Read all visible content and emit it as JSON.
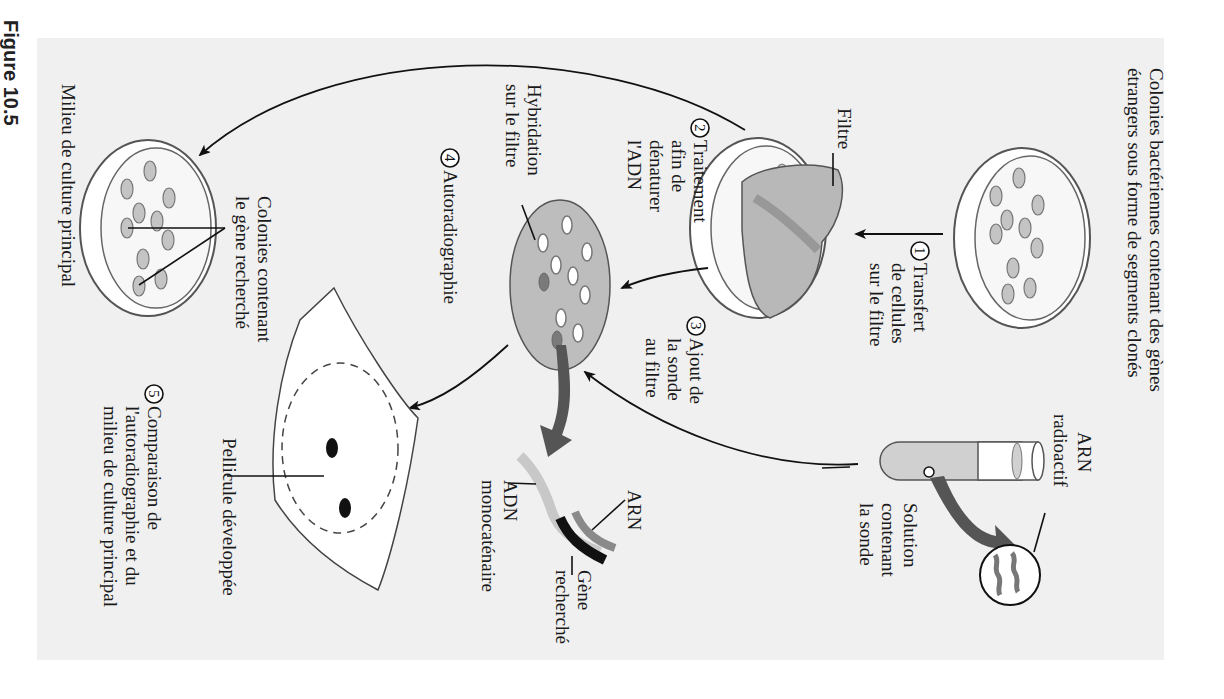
{
  "figure": {
    "label": "Figure 10.5",
    "orientation": "rotated 90° clockwise",
    "colors": {
      "panel_background": "#f0f0f0",
      "colony_fill": "#c4c4c4",
      "filter_fill": "#b8b8b8",
      "rna_strand": "#8a8a8a",
      "dna_strand": "#c8c8c8",
      "target_gene": "#111111",
      "big_arrow": "#555555"
    }
  },
  "labels": {
    "source_colonies": [
      "Colonies bactériennes contenant des gènes",
      "étrangers sous forme de segments clonés"
    ],
    "filter": "Filtre",
    "probe_rna": [
      "ARN",
      "radioactif"
    ],
    "probe_solution": [
      "Solution",
      "contenant",
      "la sonde"
    ],
    "hybridization": [
      "Hybridation",
      "sur le filtre"
    ],
    "rna": "ARN",
    "target_gene": [
      "Gène",
      "recherché"
    ],
    "ssdna": [
      "ADN",
      "monocaténaire"
    ],
    "developed_film": "Pellicule développée",
    "colonies_with_gene": [
      "Colonies contenant",
      "le gène recherché"
    ],
    "master_plate": "Milieu de culture principal"
  },
  "steps": [
    {
      "num": "1",
      "lines": [
        "Transfert",
        "de cellules",
        "sur le filtre"
      ]
    },
    {
      "num": "2",
      "lines": [
        "Traitement",
        "afin de",
        "dénaturer",
        "l'ADN"
      ]
    },
    {
      "num": "3",
      "lines": [
        "Ajout de",
        "la sonde",
        "au filtre"
      ]
    },
    {
      "num": "4",
      "lines": [
        "Autoradiographie"
      ]
    },
    {
      "num": "5",
      "lines": [
        "Comparaison de",
        "l'autoradiographie et du",
        "milieu de culture principal"
      ]
    }
  ]
}
